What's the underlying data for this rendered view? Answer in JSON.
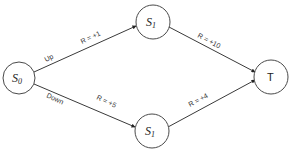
{
  "diagram": {
    "type": "state-transition-graph",
    "nodes": [
      {
        "id": "s0",
        "label": "S",
        "subscript": "0"
      },
      {
        "id": "s1_top",
        "label": "S",
        "subscript": "1"
      },
      {
        "id": "s1_bottom",
        "label": "S",
        "subscript": "1"
      },
      {
        "id": "t",
        "label": "T"
      }
    ],
    "edges": [
      {
        "from": "s0",
        "to": "s1_top",
        "action": "Up",
        "reward": "R = +1"
      },
      {
        "from": "s0",
        "to": "s1_bottom",
        "action": "Down",
        "reward": "R = +5"
      },
      {
        "from": "s1_top",
        "to": "t",
        "reward": "R = +10"
      },
      {
        "from": "s1_bottom",
        "to": "t",
        "reward": "R = +4"
      }
    ]
  },
  "colors": {
    "stroke": "#4a4a4a",
    "text": "#222222",
    "background": "#ffffff"
  }
}
